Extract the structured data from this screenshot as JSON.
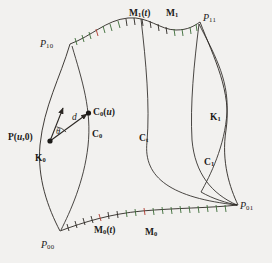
{
  "figure": {
    "background_color": "#f2f1ef",
    "stroke_color": "#2b2723",
    "tick_colors": [
      "#3a6b35",
      "#b03a2e",
      "#2b2723"
    ],
    "width": 272,
    "height": 263
  },
  "labels": {
    "p10": {
      "base": "P",
      "sub": "10",
      "x": 40,
      "y": 39,
      "size": 10
    },
    "p11": {
      "base": "P",
      "sub": "11",
      "x": 203,
      "y": 13,
      "size": 10
    },
    "p00": {
      "base": "P",
      "sub": "00",
      "x": 41,
      "y": 240,
      "size": 10
    },
    "p01": {
      "base": "P",
      "sub": "01",
      "x": 240,
      "y": 201,
      "size": 10
    },
    "m1_t": {
      "base": "M",
      "sub": "1",
      "arg": "t",
      "x": 129,
      "y": 9,
      "size": 9
    },
    "m1": {
      "base": "M",
      "sub": "1",
      "x": 166,
      "y": 9,
      "size": 9
    },
    "m0_t": {
      "base": "M",
      "sub": "0",
      "arg": "t",
      "x": 94,
      "y": 226,
      "size": 9
    },
    "m0": {
      "base": "M",
      "sub": "0",
      "x": 145,
      "y": 228,
      "size": 9
    },
    "c0_u": {
      "base": "C",
      "sub": "0",
      "arg": "u",
      "x": 93,
      "y": 108,
      "size": 9
    },
    "c0": {
      "base": "C",
      "sub": "0",
      "x": 92,
      "y": 130,
      "size": 9
    },
    "ct": {
      "base": "C",
      "sub": "t",
      "x": 139,
      "y": 134,
      "size": 9
    },
    "c1": {
      "base": "C",
      "sub": "1",
      "x": 204,
      "y": 158,
      "size": 9
    },
    "k0": {
      "base": "K",
      "sub": "0",
      "x": 35,
      "y": 154,
      "size": 9
    },
    "k1": {
      "base": "K",
      "sub": "1",
      "x": 210,
      "y": 113,
      "size": 9
    },
    "p_u_0": {
      "base": "P",
      "paren": "(",
      "arg": "u",
      "comma": ",0)",
      "x": 8,
      "y": 133,
      "size": 9
    },
    "d": {
      "text": "d",
      "x": 72,
      "y": 113,
      "size": 9
    },
    "theta": {
      "text": "θ",
      "x": 56,
      "y": 128,
      "size": 8
    }
  },
  "curves": {
    "top_boundary_M1": "top boundary curve M1 from P10 to P11 with parameter ticks",
    "bottom_boundary_M0": "bottom boundary curve M0 from P00 to P01 with parameter ticks",
    "left_boundary_K0": "left boundary curve K0 from P10 to P00",
    "right_boundary_K1": "right boundary curve K1 from P11 to P01",
    "interior_C0": "interior curve C0",
    "interior_Ct": "interior curve Ct",
    "interior_C1": "interior curve C1"
  },
  "markers": {
    "point_P_u_0": "filled dot at P(u,0)",
    "point_C0_u": "filled dot at C0(u)",
    "vector_d": "arrow from P(u,0) to C0(u)",
    "vector_tangent": "tangent arrow from P(u,0) upward",
    "angle_theta": "angle arc between tangent vector and d"
  }
}
